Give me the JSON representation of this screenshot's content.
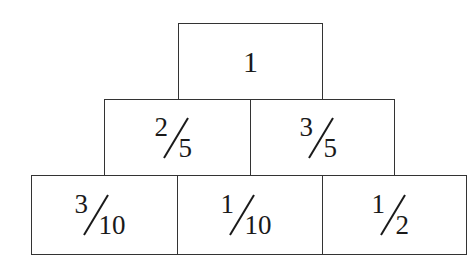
{
  "diagram": {
    "rows": [
      {
        "cells": [
          {
            "label": "1",
            "type": "whole"
          }
        ]
      },
      {
        "cells": [
          {
            "label": "2/5",
            "numerator": "2",
            "denominator": "5",
            "type": "fraction"
          },
          {
            "label": "3/5",
            "numerator": "3",
            "denominator": "5",
            "type": "fraction"
          }
        ]
      },
      {
        "cells": [
          {
            "label": "3/10",
            "numerator": "3",
            "denominator": "10",
            "type": "fraction"
          },
          {
            "label": "1/10",
            "numerator": "1",
            "denominator": "10",
            "type": "fraction"
          },
          {
            "label": "1/2",
            "numerator": "1",
            "denominator": "2",
            "type": "fraction"
          }
        ]
      }
    ],
    "colors": {
      "border": "#333333",
      "text": "#1a1a1a",
      "background": "#ffffff"
    }
  }
}
